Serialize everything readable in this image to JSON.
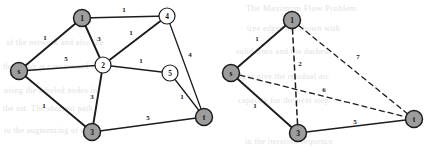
{
  "figure": {
    "background_color": "#ffffff",
    "ink_color": "#1d1d1d",
    "shaded_node_color": "#9d9d9d",
    "open_node_color": "#ffffff",
    "ghost_text_color": "#cfcfcf"
  },
  "graphs": [
    {
      "id": "left-graph",
      "name": "original-weighted-graph",
      "nodes": [
        {
          "id": "s",
          "label": "s",
          "x": 19,
          "y": 71,
          "r": 8.5,
          "style": "shaded"
        },
        {
          "id": "n1",
          "label": "1",
          "x": 82,
          "y": 18,
          "r": 8.5,
          "style": "shaded"
        },
        {
          "id": "n2",
          "label": "2",
          "x": 103,
          "y": 65,
          "r": 8.0,
          "style": "open"
        },
        {
          "id": "n3",
          "label": "3",
          "x": 92,
          "y": 132,
          "r": 8.5,
          "style": "shaded"
        },
        {
          "id": "n4",
          "label": "4",
          "x": 167,
          "y": 16,
          "r": 8.0,
          "style": "open"
        },
        {
          "id": "n5",
          "label": "5",
          "x": 170,
          "y": 73,
          "r": 8.0,
          "style": "open"
        },
        {
          "id": "t",
          "label": "t",
          "x": 204,
          "y": 117,
          "r": 8.5,
          "style": "shaded"
        }
      ],
      "edges": [
        {
          "from": "s",
          "to": "n1",
          "weight": "1",
          "style": "solid",
          "lw": 1.9,
          "lx": 45,
          "ly": 40
        },
        {
          "from": "s",
          "to": "n2",
          "weight": "5",
          "style": "solid",
          "lw": 1.3,
          "lx": 66,
          "ly": 61
        },
        {
          "from": "s",
          "to": "n3",
          "weight": "1",
          "style": "solid",
          "lw": 1.9,
          "lx": 44,
          "ly": 108
        },
        {
          "from": "n1",
          "to": "n2",
          "weight": "3",
          "style": "solid",
          "lw": 1.9,
          "lx": 99,
          "ly": 41
        },
        {
          "from": "n1",
          "to": "n4",
          "weight": "1",
          "style": "solid",
          "lw": 1.3,
          "lx": 124,
          "ly": 12
        },
        {
          "from": "n2",
          "to": "n4",
          "weight": "1",
          "style": "solid",
          "lw": 1.9,
          "lx": 131,
          "ly": 35
        },
        {
          "from": "n2",
          "to": "n3",
          "weight": "3",
          "style": "solid",
          "lw": 1.9,
          "lx": 92,
          "ly": 99
        },
        {
          "from": "n2",
          "to": "n5",
          "weight": "1",
          "style": "solid",
          "lw": 1.3,
          "lx": 141,
          "ly": 63
        },
        {
          "from": "n4",
          "to": "t",
          "weight": "4",
          "style": "solid",
          "lw": 1.3,
          "lx": 190,
          "ly": 57
        },
        {
          "from": "n5",
          "to": "t",
          "weight": "1",
          "style": "solid",
          "lw": 1.3,
          "lx": 182,
          "ly": 99
        },
        {
          "from": "n3",
          "to": "t",
          "weight": "5",
          "style": "solid",
          "lw": 1.3,
          "lx": 148,
          "ly": 120
        }
      ]
    },
    {
      "id": "right-graph",
      "name": "reduced-weighted-graph",
      "nodes": [
        {
          "id": "s",
          "label": "s",
          "x": 231,
          "y": 73,
          "r": 8.5,
          "style": "shaded"
        },
        {
          "id": "n1",
          "label": "1",
          "x": 292,
          "y": 20,
          "r": 8.5,
          "style": "shaded"
        },
        {
          "id": "n3",
          "label": "3",
          "x": 298,
          "y": 133,
          "r": 8.5,
          "style": "shaded"
        },
        {
          "id": "t",
          "label": "t",
          "x": 414,
          "y": 119,
          "r": 8.5,
          "style": "shaded"
        }
      ],
      "edges": [
        {
          "from": "s",
          "to": "n1",
          "weight": "1",
          "style": "solid",
          "lw": 1.9,
          "lx": 257,
          "ly": 41
        },
        {
          "from": "s",
          "to": "n3",
          "weight": "1",
          "style": "solid",
          "lw": 1.9,
          "lx": 255,
          "ly": 108
        },
        {
          "from": "n3",
          "to": "t",
          "weight": "5",
          "style": "solid",
          "lw": 1.4,
          "lx": 355,
          "ly": 124
        },
        {
          "from": "n1",
          "to": "n3",
          "weight": "2",
          "style": "dashed",
          "lw": 1.5,
          "lx": 300,
          "ly": 66
        },
        {
          "from": "s",
          "to": "t",
          "weight": "6",
          "style": "dashed",
          "lw": 1.3,
          "lx": 324,
          "ly": 92
        },
        {
          "from": "n1",
          "to": "t",
          "weight": "7",
          "style": "dashed",
          "lw": 1.3,
          "lx": 358,
          "ly": 59
        }
      ]
    }
  ],
  "ghost_text": [
    {
      "text": "The  Maximum  Flow  Problem",
      "x": 246,
      "y": 3,
      "size": 8.5
    },
    {
      "text": "of  the  network  and  also  the",
      "x": 6,
      "y": 38,
      "size": 8.0
    },
    {
      "text": "the  graph  is  constructed  by",
      "x": 3,
      "y": 62,
      "size": 8.0
    },
    {
      "text": "using  the  labeled  nodes  in",
      "x": 4,
      "y": 86,
      "size": 8.0
    },
    {
      "text": "the  set.   The   shortest  path",
      "x": 3,
      "y": 104,
      "size": 8.0
    },
    {
      "text": "to  the  augmenting  of  each",
      "x": 4,
      "y": 126,
      "size": 8.0
    },
    {
      "text": "tree  edges  are  shown  with",
      "x": 247,
      "y": 24,
      "size": 8.0
    },
    {
      "text": "solid  lines  and  the  dashed",
      "x": 236,
      "y": 47,
      "size": 8.0
    },
    {
      "text": "edges  give  the  residual  arc",
      "x": 234,
      "y": 72,
      "size": 8.0
    },
    {
      "text": "capacity  for  the  next  step",
      "x": 238,
      "y": 96,
      "size": 8.0
    },
    {
      "text": "in  the  iteration  sequence",
      "x": 245,
      "y": 137,
      "size": 8.0
    }
  ]
}
